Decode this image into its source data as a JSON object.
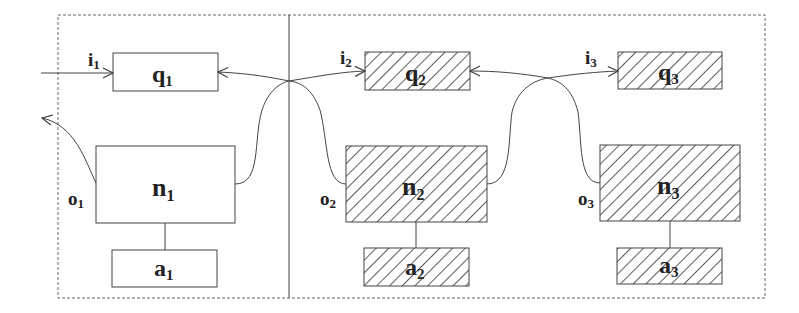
{
  "diagram": {
    "type": "agent-network",
    "panels": [
      {
        "id": "left",
        "label": "agent 1 panel"
      },
      {
        "id": "right",
        "label": "agents 2-3 panel"
      }
    ],
    "agents": [
      {
        "id": 1,
        "hatched": false,
        "queue": {
          "main": "q",
          "sub": "1"
        },
        "node": {
          "main": "n",
          "sub": "1"
        },
        "action": {
          "main": "a",
          "sub": "1"
        },
        "input": {
          "main": "i",
          "sub": "1"
        },
        "output": {
          "main": "o",
          "sub": "1"
        }
      },
      {
        "id": 2,
        "hatched": true,
        "queue": {
          "main": "q",
          "sub": "2"
        },
        "node": {
          "main": "n",
          "sub": "2"
        },
        "action": {
          "main": "a",
          "sub": "2"
        },
        "input": {
          "main": "i",
          "sub": "2"
        },
        "output": {
          "main": "o",
          "sub": "2"
        }
      },
      {
        "id": 3,
        "hatched": true,
        "queue": {
          "main": "q",
          "sub": "3"
        },
        "node": {
          "main": "n",
          "sub": "3"
        },
        "action": {
          "main": "a",
          "sub": "3"
        },
        "input": {
          "main": "i",
          "sub": "3"
        },
        "output": {
          "main": "o",
          "sub": "3"
        }
      }
    ],
    "edges": [
      {
        "from": "external",
        "to": "q1",
        "label": "i1"
      },
      {
        "from": "n1",
        "to": "external",
        "label": "o1"
      },
      {
        "from": "n1",
        "to": "q2",
        "label": "i2"
      },
      {
        "from": "n2",
        "to": "q1",
        "label": "o2"
      },
      {
        "from": "n2",
        "to": "q3",
        "label": "i3"
      },
      {
        "from": "n3",
        "to": "q2",
        "label": "o3"
      }
    ],
    "colors": {
      "stroke": "#444444",
      "dashed": "#666666",
      "hatch": "#333333",
      "text": "#222222"
    }
  }
}
